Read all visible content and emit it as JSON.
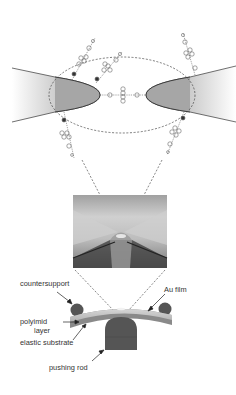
{
  "figure": {
    "type": "schematic of mechanically controllable break-junction (MCBJ) with molecular junction",
    "panels": [
      {
        "id": "molecular-junction",
        "description": "Two Au electrode tips with molecules bridging gap, dashed ellipse highlight"
      },
      {
        "id": "sem-image",
        "description": "Micrograph of suspended bridge constriction"
      },
      {
        "id": "bending-setup",
        "description": "Three-point bending mechanism"
      }
    ]
  },
  "labels": {
    "countersupport": "countersupport",
    "polyimid_line1": "polyimid",
    "polyimid_line2": "layer",
    "elastic_substrate": "elastic substrate",
    "pushing_rod": "pushing rod",
    "au_film": "Au film"
  },
  "colors": {
    "electrode_dark": "#9a9a9a",
    "electrode_light": "#ffffff",
    "outline": "#333333",
    "dash": "#444444",
    "support": "#555555",
    "substrate": "#8a8a8a",
    "polyimid": "#c4c4c4",
    "photo_bg": "#b8b8b8"
  }
}
